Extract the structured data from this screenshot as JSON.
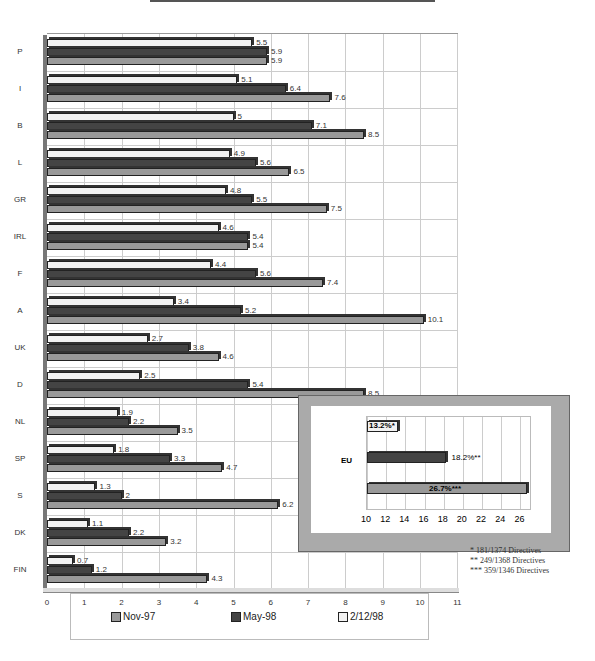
{
  "chart_data": {
    "type": "bar",
    "orientation": "horizontal",
    "categories": [
      "P",
      "I",
      "B",
      "L",
      "GR",
      "IRL",
      "F",
      "A",
      "UK",
      "D",
      "NL",
      "SP",
      "S",
      "DK",
      "FIN"
    ],
    "series": [
      {
        "name": "Nov-97",
        "color": "#999999",
        "values": [
          5.9,
          7.6,
          8.5,
          6.5,
          7.5,
          5.4,
          7.4,
          10.1,
          4.6,
          8.5,
          3.5,
          4.7,
          6.2,
          3.2,
          4.3
        ]
      },
      {
        "name": "May-98",
        "color": "#444444",
        "values": [
          5.9,
          6.4,
          7.1,
          5.6,
          5.5,
          5.4,
          5.6,
          5.2,
          3.8,
          5.4,
          2.2,
          3.3,
          2.0,
          2.2,
          1.2
        ]
      },
      {
        "name": "2/12/98",
        "color": "#f2f2f2",
        "values": [
          5.5,
          5.1,
          5.0,
          4.9,
          4.8,
          4.6,
          4.4,
          3.4,
          2.7,
          2.5,
          1.9,
          1.8,
          1.3,
          1.1,
          0.7
        ]
      }
    ],
    "value_labels": {
      "Nov-97": [
        "5.9",
        "7.6",
        "8.5",
        "6.5",
        "7.5",
        "5.4",
        "7.4",
        "10.1",
        "4.6",
        "8.5",
        "3.5",
        "4.7",
        "6.2",
        "3.2",
        "4.3"
      ],
      "May-98": [
        "5.9",
        "6.4",
        "7.1",
        "5.6",
        "5.5",
        "5.4",
        "5.6",
        "5.2",
        "3.8",
        "5.4",
        "2.2",
        "3.3",
        "2",
        "2.2",
        "1.2"
      ],
      "2/12/98": [
        "5.5",
        "5.1",
        "5",
        "4.9",
        "4.8",
        "4.6",
        "4.4",
        "3.4",
        "2.7",
        "2.5",
        "1.9",
        "1.8",
        "1.3",
        "1.1",
        "0.7"
      ]
    },
    "xticks": [
      "0",
      "1",
      "2",
      "3",
      "4",
      "5",
      "6",
      "7",
      "8",
      "9",
      "10",
      "11"
    ],
    "xlim": [
      0,
      11
    ],
    "grid": true,
    "legend_position": "bottom",
    "inset": {
      "type": "bar",
      "category": "EU",
      "xticks": [
        "10",
        "12",
        "14",
        "16",
        "18",
        "20",
        "22",
        "24",
        "26"
      ],
      "xlim": [
        10,
        27
      ],
      "bars": [
        {
          "series": "2/12/98",
          "value": 13.2,
          "label": "13.2%*"
        },
        {
          "series": "May-98",
          "value": 18.2,
          "label": "18.2%**"
        },
        {
          "series": "Nov-97",
          "value": 26.7,
          "label": "26.7%***"
        }
      ]
    },
    "footnotes": [
      "*    181/1374 Directives",
      "**   249/1368 Directives",
      "***  359/1346 Directives"
    ]
  },
  "legend": {
    "items": [
      "Nov-97",
      "May-98",
      "2/12/98"
    ]
  }
}
